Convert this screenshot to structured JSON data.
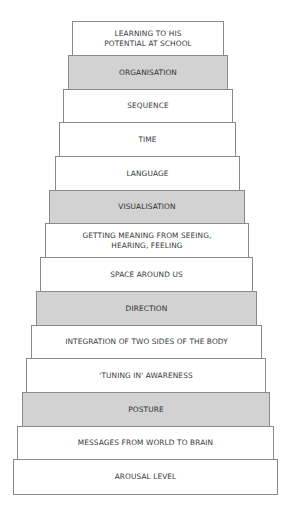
{
  "diagram": {
    "type": "staircase",
    "fill_colors": {
      "plain": "#ffffff",
      "shaded": "#d2d2d2"
    },
    "steps_top_to_bottom": [
      {
        "label": "LEARNING TO HIS\nPOTENTIAL AT SCHOOL",
        "shaded": false
      },
      {
        "label": "ORGANISATION",
        "shaded": true
      },
      {
        "label": "SEQUENCE",
        "shaded": false
      },
      {
        "label": "TIME",
        "shaded": false
      },
      {
        "label": "LANGUAGE",
        "shaded": false
      },
      {
        "label": "VISUALISATION",
        "shaded": true
      },
      {
        "label": "GETTING MEANING FROM SEEING,\nHEARING, FEELING",
        "shaded": false
      },
      {
        "label": "SPACE AROUND US",
        "shaded": false
      },
      {
        "label": "DIRECTION",
        "shaded": true
      },
      {
        "label": "INTEGRATION OF TWO SIDES OF THE BODY",
        "shaded": false
      },
      {
        "label": "'TUNING IN' AWARENESS",
        "shaded": false
      },
      {
        "label": "POSTURE",
        "shaded": true
      },
      {
        "label": "MESSAGES FROM WORLD TO BRAIN",
        "shaded": false
      },
      {
        "label": "AROUSAL LEVEL",
        "shaded": false
      }
    ]
  }
}
